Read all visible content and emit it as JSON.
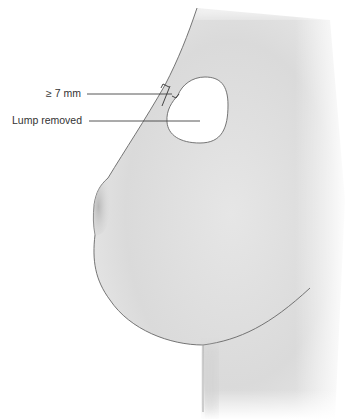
{
  "diagram": {
    "labels": {
      "margin": "≥ 7 mm",
      "lump": "Lump removed"
    },
    "colors": {
      "skin": "#dcdcdc",
      "outline": "#555555",
      "cavity": "#ffffff",
      "leader": "#444444",
      "text": "#333333"
    }
  }
}
